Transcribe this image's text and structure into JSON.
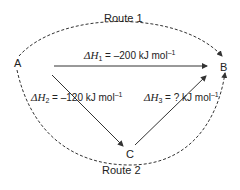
{
  "nodes": {
    "A": "A",
    "B": "B",
    "C": "C"
  },
  "routes": {
    "route1": "Route 1",
    "route2": "Route 2"
  },
  "enthalpies": {
    "dh1": {
      "symbol": "ΔH",
      "sub": "1",
      "value": " = –200 kJ mol",
      "sup": "–1"
    },
    "dh2": {
      "symbol": "ΔH",
      "sub": "2",
      "value": " = –120 kJ mol",
      "sup": "–1"
    },
    "dh3": {
      "symbol": "ΔH",
      "sub": "3",
      "value": " = ? kJ mol",
      "sup": "–1"
    }
  }
}
